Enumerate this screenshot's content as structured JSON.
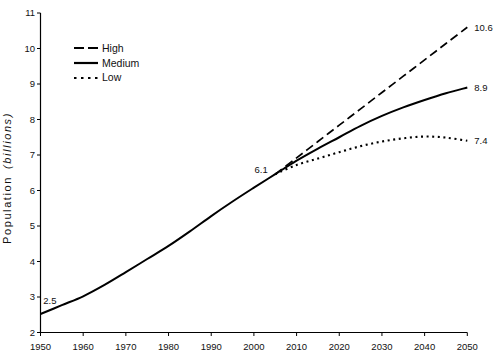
{
  "chart_data": {
    "type": "line",
    "title": "",
    "xlabel": "",
    "ylabel": "Population (billions)",
    "ylabel_main": "Population",
    "ylabel_unit": "(billions)",
    "xlim": [
      1950,
      2050
    ],
    "ylim": [
      2,
      11
    ],
    "x_ticks": [
      1950,
      1960,
      1970,
      1980,
      1990,
      2000,
      2010,
      2020,
      2030,
      2040,
      2050
    ],
    "y_ticks": [
      2,
      3,
      4,
      5,
      6,
      7,
      8,
      9,
      10,
      11
    ],
    "grid": false,
    "legend_position": "top-left",
    "colors": {
      "line": "#000000",
      "text": "#111111",
      "background": "#ffffff"
    },
    "series": [
      {
        "name": "High",
        "style": "dashed",
        "x": [
          2005,
          2010,
          2015,
          2020,
          2025,
          2030,
          2035,
          2040,
          2045,
          2050
        ],
        "values": [
          6.46,
          6.92,
          7.38,
          7.84,
          8.3,
          8.76,
          9.22,
          9.68,
          10.14,
          10.6
        ],
        "end_label": "10.6"
      },
      {
        "name": "Medium",
        "style": "solid",
        "x": [
          1950,
          1955,
          1960,
          1965,
          1970,
          1975,
          1980,
          1985,
          1990,
          1995,
          2000,
          2005,
          2010,
          2015,
          2020,
          2025,
          2030,
          2035,
          2040,
          2045,
          2050
        ],
        "values": [
          2.52,
          2.77,
          3.02,
          3.34,
          3.7,
          4.07,
          4.44,
          4.85,
          5.28,
          5.69,
          6.08,
          6.46,
          6.84,
          7.18,
          7.5,
          7.82,
          8.1,
          8.34,
          8.55,
          8.74,
          8.9
        ],
        "end_label": "8.9"
      },
      {
        "name": "Low",
        "style": "dotted",
        "x": [
          2005,
          2010,
          2015,
          2020,
          2025,
          2030,
          2035,
          2040,
          2045,
          2050
        ],
        "values": [
          6.46,
          6.72,
          6.9,
          7.08,
          7.25,
          7.38,
          7.47,
          7.52,
          7.49,
          7.4
        ],
        "end_label": "7.4"
      }
    ],
    "annotations": [
      {
        "text": "2.5",
        "x": 1952.2,
        "y": 2.89
      },
      {
        "text": "6.1",
        "x": 2001.7,
        "y": 6.58
      }
    ]
  }
}
